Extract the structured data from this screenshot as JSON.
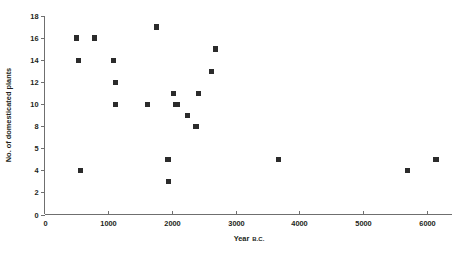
{
  "chart_data": {
    "type": "scatter",
    "title": "",
    "xlabel": "Year B.C.",
    "xlabel_main": "Year",
    "xlabel_era": "B.C.",
    "ylabel": "No. of domesticated plants",
    "xlim": [
      0,
      6400
    ],
    "ylim": [
      0,
      18
    ],
    "grid": false,
    "legend": null,
    "marker": "filled-square",
    "marker_color": "#2b2b2b",
    "axis_color": "#6f6f6f",
    "xticks": [
      0,
      1000,
      2000,
      3000,
      4000,
      5000,
      6000
    ],
    "xtick_labels": [
      "0",
      "1000",
      "2000",
      "3000",
      "4000",
      "5000",
      "6000"
    ],
    "yticks": [
      0,
      2,
      4,
      6,
      8,
      10,
      12,
      14,
      16,
      18
    ],
    "ytick_labels": [
      "0",
      "2",
      "4",
      "5",
      "8",
      "10",
      "12",
      "14",
      "16",
      "18"
    ],
    "x": [
      500,
      540,
      560,
      790,
      1080,
      1110,
      1120,
      1620,
      1760,
      1940,
      1950,
      2020,
      2060,
      2080,
      2240,
      2380,
      2420,
      2620,
      2680,
      3680,
      5700,
      6150
    ],
    "y": [
      16,
      14,
      4,
      16,
      14,
      12,
      10,
      10,
      17,
      5,
      3,
      11,
      10,
      10,
      9,
      8,
      11,
      13,
      15,
      5,
      4,
      5
    ],
    "points": [
      {
        "x": 500,
        "y": 16
      },
      {
        "x": 540,
        "y": 14
      },
      {
        "x": 560,
        "y": 4
      },
      {
        "x": 790,
        "y": 16
      },
      {
        "x": 1080,
        "y": 14
      },
      {
        "x": 1110,
        "y": 12
      },
      {
        "x": 1120,
        "y": 10
      },
      {
        "x": 1620,
        "y": 10
      },
      {
        "x": 1760,
        "y": 17
      },
      {
        "x": 1940,
        "y": 5
      },
      {
        "x": 1950,
        "y": 3
      },
      {
        "x": 2020,
        "y": 11
      },
      {
        "x": 2060,
        "y": 10
      },
      {
        "x": 2080,
        "y": 10
      },
      {
        "x": 2240,
        "y": 9
      },
      {
        "x": 2380,
        "y": 8
      },
      {
        "x": 2420,
        "y": 11
      },
      {
        "x": 2620,
        "y": 13
      },
      {
        "x": 2680,
        "y": 15
      },
      {
        "x": 3680,
        "y": 5
      },
      {
        "x": 5700,
        "y": 4
      },
      {
        "x": 6150,
        "y": 5
      }
    ]
  }
}
